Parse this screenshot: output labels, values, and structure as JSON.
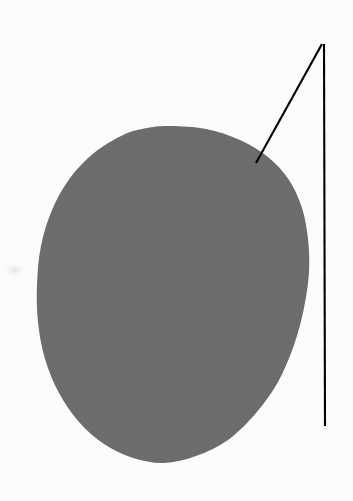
{
  "figure": {
    "background_color": "#ffffff",
    "width": 353,
    "height": 501,
    "caption": "",
    "labels": []
  },
  "shapes": {
    "blob": {
      "name": "shaded-oval-region",
      "fill_color": "#6e6e6e",
      "edge_color": "#6e6e6e",
      "opacity": 1,
      "description": "large solid gray egg-shaped blob, slightly tilted, flatter on upper right",
      "bbox": {
        "x": 37,
        "y": 126,
        "width": 273,
        "height": 338
      },
      "center": {
        "x": 173,
        "y": 295
      },
      "outline_points": [
        [
          170,
          126
        ],
        [
          206,
          129
        ],
        [
          240,
          140
        ],
        [
          268,
          157
        ],
        [
          289,
          180
        ],
        [
          302,
          208
        ],
        [
          308,
          239
        ],
        [
          309,
          272
        ],
        [
          304,
          308
        ],
        [
          294,
          345
        ],
        [
          278,
          382
        ],
        [
          256,
          413
        ],
        [
          228,
          440
        ],
        [
          196,
          456
        ],
        [
          164,
          463
        ],
        [
          133,
          458
        ],
        [
          104,
          444
        ],
        [
          79,
          422
        ],
        [
          59,
          393
        ],
        [
          45,
          359
        ],
        [
          38,
          322
        ],
        [
          37,
          284
        ],
        [
          41,
          246
        ],
        [
          52,
          210
        ],
        [
          70,
          178
        ],
        [
          94,
          153
        ],
        [
          123,
          135
        ],
        [
          147,
          128
        ]
      ]
    },
    "leader_line": {
      "name": "leader-line",
      "stroke_color": "#000000",
      "stroke_width": 2,
      "description": "two-segment black pointer: diagonal from blob edge up to apex, then vertical down the right margin",
      "segments": [
        {
          "name": "diagonal-segment",
          "from": [
            256,
            163
          ],
          "to": [
            322,
            44
          ]
        },
        {
          "name": "vertical-segment",
          "from": [
            324,
            44
          ],
          "to": [
            325,
            426
          ]
        }
      ],
      "apex": {
        "x": 322,
        "y": 44
      },
      "tip": {
        "x": 256,
        "y": 163
      }
    },
    "smudge": {
      "name": "faint-print-smudge",
      "fill_color": "#d8d8d8",
      "opacity": 0.55,
      "center": {
        "x": 15,
        "y": 270
      },
      "radius_x": 7,
      "radius_y": 3
    }
  },
  "palette": {
    "paper_white": "#ffffff",
    "blob_gray": "#6e6e6e",
    "line_black": "#000000",
    "smudge_gray": "#d8d8d8"
  }
}
